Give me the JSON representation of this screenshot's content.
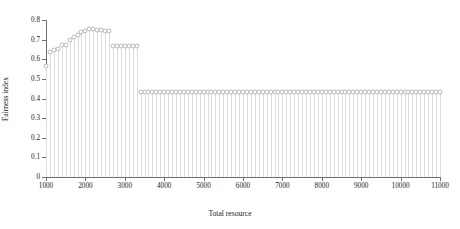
{
  "chart_data": {
    "type": "line",
    "title": "",
    "xlabel": "Total resource",
    "ylabel": "Fairness index",
    "xlim": [
      1000,
      11000
    ],
    "ylim": [
      0,
      0.8
    ],
    "grid": false,
    "legend": null,
    "marker": "circle-open",
    "style": "stem-with-open-circle-markers",
    "xticks": [
      1000,
      2000,
      3000,
      4000,
      5000,
      6000,
      7000,
      8000,
      9000,
      10000,
      11000
    ],
    "xtick_labels": [
      "1000",
      "2000",
      "3000",
      "4000",
      "5000",
      "6000",
      "7000",
      "8000",
      "9000",
      "10000",
      "11000"
    ],
    "yticks": [
      0,
      0.1,
      0.2,
      0.3,
      0.4,
      0.5,
      0.6,
      0.7,
      0.8
    ],
    "ytick_labels": [
      "0",
      "0.1",
      "0.2",
      "0.3",
      "0.4",
      "0.5",
      "0.6",
      "0.7",
      "0.8"
    ],
    "x": [
      1000,
      1100,
      1200,
      1300,
      1400,
      1500,
      1600,
      1700,
      1800,
      1900,
      2000,
      2100,
      2200,
      2300,
      2400,
      2500,
      2600,
      2700,
      2800,
      2900,
      3000,
      3100,
      3200,
      3300,
      3400,
      3500,
      3600,
      3700,
      3800,
      3900,
      4000,
      4100,
      4200,
      4300,
      4400,
      4500,
      4600,
      4700,
      4800,
      4900,
      5000,
      5100,
      5200,
      5300,
      5400,
      5500,
      5600,
      5700,
      5800,
      5900,
      6000,
      6100,
      6200,
      6300,
      6400,
      6500,
      6600,
      6700,
      6800,
      6900,
      7000,
      7100,
      7200,
      7300,
      7400,
      7500,
      7600,
      7700,
      7800,
      7900,
      8000,
      8100,
      8200,
      8300,
      8400,
      8500,
      8600,
      8700,
      8800,
      8900,
      9000,
      9100,
      9200,
      9300,
      9400,
      9500,
      9600,
      9700,
      9800,
      9900,
      10000,
      10100,
      10200,
      10300,
      10400,
      10500,
      10600,
      10700,
      10800,
      10900,
      11000
    ],
    "y": [
      0.565,
      0.635,
      0.648,
      0.652,
      0.672,
      0.675,
      0.7,
      0.712,
      0.726,
      0.74,
      0.743,
      0.752,
      0.755,
      0.748,
      0.747,
      0.746,
      0.745,
      0.67,
      0.67,
      0.67,
      0.67,
      0.67,
      0.67,
      0.67,
      0.435,
      0.435,
      0.435,
      0.435,
      0.435,
      0.435,
      0.435,
      0.435,
      0.435,
      0.435,
      0.435,
      0.435,
      0.435,
      0.435,
      0.435,
      0.435,
      0.435,
      0.435,
      0.435,
      0.435,
      0.435,
      0.435,
      0.435,
      0.435,
      0.435,
      0.435,
      0.435,
      0.435,
      0.435,
      0.435,
      0.435,
      0.435,
      0.435,
      0.435,
      0.435,
      0.435,
      0.435,
      0.435,
      0.435,
      0.435,
      0.435,
      0.435,
      0.435,
      0.435,
      0.435,
      0.435,
      0.435,
      0.435,
      0.435,
      0.435,
      0.435,
      0.435,
      0.435,
      0.435,
      0.435,
      0.435,
      0.435,
      0.435,
      0.435,
      0.435,
      0.435,
      0.435,
      0.435,
      0.435,
      0.435,
      0.435,
      0.435,
      0.435,
      0.435,
      0.435,
      0.435,
      0.435,
      0.435,
      0.435,
      0.435,
      0.435,
      0.435
    ],
    "annotations": {
      "peak_value": 0.755,
      "peak_x": 2200,
      "plateau_value": 0.67,
      "plateau_range": [
        2700,
        3300
      ],
      "floor_value": 0.435,
      "floor_range": [
        3400,
        11000
      ],
      "first_value": 0.565
    },
    "colors": {
      "axis": "#6f6f6f",
      "stem": "#dcdcdc",
      "marker_edge": "#b9b9b9",
      "marker_face": "#ffffff",
      "text": "#1a1a1a",
      "background": "#ffffff"
    }
  }
}
